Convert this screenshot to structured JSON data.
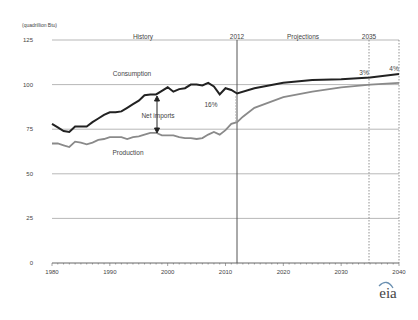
{
  "chart_data": {
    "type": "line",
    "title": "",
    "ylabel": "(quadrillion Btu)",
    "xlabel": "",
    "ylim": [
      0,
      125
    ],
    "xlim": [
      1980,
      2040
    ],
    "yticks": [
      0,
      25,
      50,
      75,
      100,
      125
    ],
    "xticks": [
      1980,
      1990,
      2000,
      2010,
      2020,
      2030,
      2040
    ],
    "grid": "horizontal",
    "annotations": {
      "history": "History",
      "projections": "Projections",
      "year_2012": "2012",
      "year_2035": "2035",
      "net_imports": "Net imports",
      "pct_2012": "16%",
      "pct_2035": "3%",
      "pct_2040": "4%",
      "consumption_label": "Consumption",
      "production_label": "Production"
    },
    "series": [
      {
        "name": "Consumption",
        "color": "#222222",
        "x": [
          1980,
          1981,
          1982,
          1983,
          1984,
          1985,
          1986,
          1987,
          1988,
          1989,
          1990,
          1991,
          1992,
          1993,
          1994,
          1995,
          1996,
          1997,
          1998,
          1999,
          2000,
          2001,
          2002,
          2003,
          2004,
          2005,
          2006,
          2007,
          2008,
          2009,
          2010,
          2011,
          2012,
          2015,
          2020,
          2025,
          2030,
          2035,
          2040
        ],
        "values": [
          78,
          76,
          74,
          73.5,
          76.5,
          76.5,
          76.5,
          79,
          81,
          83,
          84.5,
          84.5,
          85,
          87,
          89,
          91,
          94,
          94.5,
          94.5,
          96.5,
          98.5,
          96,
          97.5,
          98,
          100,
          100,
          99.5,
          101,
          99,
          94.5,
          98,
          97,
          95,
          98,
          101,
          102.5,
          103,
          104,
          106
        ]
      },
      {
        "name": "Production",
        "color": "#888888",
        "x": [
          1980,
          1981,
          1982,
          1983,
          1984,
          1985,
          1986,
          1987,
          1988,
          1989,
          1990,
          1991,
          1992,
          1993,
          1994,
          1995,
          1996,
          1997,
          1998,
          1999,
          2000,
          2001,
          2002,
          2003,
          2004,
          2005,
          2006,
          2007,
          2008,
          2009,
          2010,
          2011,
          2012,
          2013,
          2015,
          2020,
          2025,
          2030,
          2035,
          2040
        ],
        "values": [
          67,
          67,
          66,
          65,
          68,
          67.5,
          66.5,
          67.5,
          69,
          69.5,
          70.5,
          70.5,
          70.5,
          69.5,
          70.5,
          71,
          72,
          73,
          73,
          71.5,
          71.5,
          71.5,
          70.5,
          70,
          70,
          69.5,
          70,
          72,
          73.5,
          72,
          74.5,
          78,
          79,
          82,
          87,
          93,
          96,
          98.5,
          100,
          101
        ]
      }
    ]
  },
  "footer": {
    "logo": "eia"
  }
}
